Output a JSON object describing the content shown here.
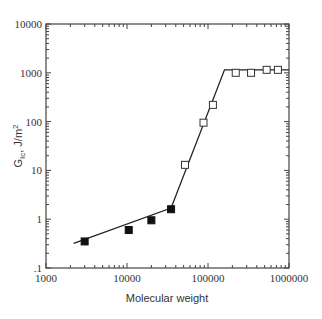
{
  "chart_data": {
    "type": "scatter",
    "title": "",
    "xlabel": "Molecular weight",
    "ylabel": "G_Ic, J/m²",
    "ylabel_parts": {
      "main": "G",
      "sub": "Ic",
      "rest": ", J/m",
      "sup": "2"
    },
    "xscale": "log",
    "yscale": "log",
    "xlim": [
      1000,
      1000000
    ],
    "ylim": [
      0.1,
      10000
    ],
    "x_ticks": [
      1000,
      10000,
      100000,
      1000000
    ],
    "x_tick_labels": [
      "1000",
      "10000",
      "100000",
      "1000000"
    ],
    "y_ticks": [
      0.1,
      1,
      10,
      100,
      1000,
      10000
    ],
    "y_tick_labels": [
      ".1",
      "1",
      "10",
      "100",
      "1000",
      "10000"
    ],
    "grid": false,
    "legend": null,
    "series": [
      {
        "name": "filled squares",
        "marker": "filled-square",
        "color": "#111111",
        "x": [
          3000,
          10500,
          20000,
          35000
        ],
        "y": [
          0.35,
          0.6,
          0.95,
          1.6
        ]
      },
      {
        "name": "open squares",
        "marker": "open-square",
        "color": "#333333",
        "x": [
          52000,
          88000,
          115000,
          220000,
          340000,
          530000,
          730000
        ],
        "y": [
          13,
          95,
          220,
          1000,
          1000,
          1150,
          1150
        ]
      },
      {
        "name": "fit line",
        "type": "line",
        "color": "#222222",
        "x": [
          2200,
          35000,
          160000,
          1000000
        ],
        "y": [
          0.32,
          1.7,
          1150,
          1150
        ]
      }
    ]
  }
}
